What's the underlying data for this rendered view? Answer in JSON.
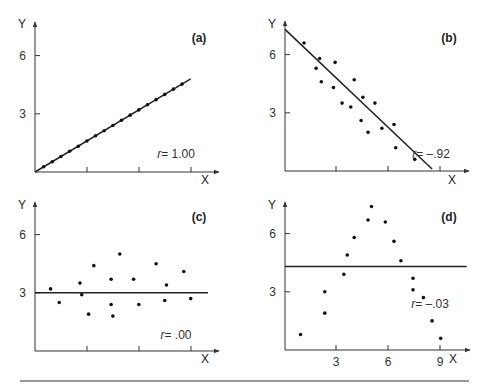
{
  "figure": {
    "bottom_rule": true
  },
  "chart_data": [
    {
      "panel": "(a)",
      "type": "scatter",
      "title": "",
      "xlabel": "X",
      "ylabel": "Y",
      "yticks": [
        "3",
        "6"
      ],
      "xticks": [],
      "ylim": [
        0,
        8
      ],
      "xlim": [
        0,
        10
      ],
      "annotation": "r = 1.00",
      "r": 1.0,
      "fit_line": {
        "x": [
          0,
          9
        ],
        "y": [
          0,
          4.8
        ]
      },
      "points": {
        "x": [
          0.5,
          1.0,
          1.5,
          2.0,
          2.5,
          3.0,
          3.5,
          4.0,
          4.5,
          5.0,
          5.5,
          6.0,
          6.5,
          7.0,
          7.5,
          8.0,
          8.5
        ],
        "y": [
          0.27,
          0.53,
          0.8,
          1.07,
          1.33,
          1.6,
          1.87,
          2.13,
          2.4,
          2.67,
          2.93,
          3.2,
          3.47,
          3.73,
          4.0,
          4.27,
          4.53
        ]
      }
    },
    {
      "panel": "(b)",
      "type": "scatter",
      "title": "",
      "xlabel": "X",
      "ylabel": "Y",
      "yticks": [
        "3",
        "6"
      ],
      "xticks": [],
      "ylim": [
        0,
        8
      ],
      "xlim": [
        0,
        10
      ],
      "annotation": "r = -.92",
      "r": -0.92,
      "fit_line": {
        "x": [
          0,
          8.5
        ],
        "y": [
          7.3,
          0.1
        ]
      },
      "points": {
        "x": [
          1.1,
          2.0,
          1.8,
          2.9,
          2.1,
          2.8,
          3.3,
          4.0,
          3.8,
          4.5,
          4.4,
          5.2,
          4.8,
          5.6,
          6.3,
          6.4,
          7.5
        ],
        "y": [
          6.6,
          5.8,
          5.3,
          5.6,
          4.6,
          4.3,
          3.5,
          4.7,
          3.3,
          3.8,
          2.6,
          3.5,
          2.0,
          2.2,
          2.4,
          1.2,
          0.6
        ]
      }
    },
    {
      "panel": "(c)",
      "type": "scatter",
      "title": "",
      "xlabel": "X",
      "ylabel": "Y",
      "yticks": [
        "3",
        "6"
      ],
      "xticks": [],
      "ylim": [
        0,
        8
      ],
      "xlim": [
        0,
        10
      ],
      "annotation": "r = .00",
      "r": 0.0,
      "fit_line": {
        "x": [
          0,
          10
        ],
        "y": [
          3.0,
          3.0
        ]
      },
      "points": {
        "x": [
          0.9,
          1.4,
          2.6,
          2.7,
          3.1,
          3.4,
          4.4,
          4.4,
          4.5,
          4.9,
          5.7,
          6.0,
          7.0,
          7.5,
          7.6,
          8.6,
          9.0
        ],
        "y": [
          3.2,
          2.5,
          3.5,
          2.9,
          1.9,
          4.4,
          3.7,
          2.4,
          1.8,
          5.0,
          3.7,
          2.4,
          4.5,
          2.6,
          3.4,
          4.1,
          2.7
        ]
      }
    },
    {
      "panel": "(d)",
      "type": "scatter",
      "title": "",
      "xlabel": "X",
      "ylabel": "Y",
      "yticks": [
        "3",
        "6"
      ],
      "xticks": [
        "3",
        "6",
        "9"
      ],
      "ylim": [
        0,
        8
      ],
      "xlim": [
        0,
        10.5
      ],
      "annotation": "r = -.03",
      "r": -0.03,
      "fit_line": {
        "x": [
          0,
          10.5
        ],
        "y": [
          4.3,
          4.3
        ]
      },
      "points": {
        "x": [
          0.9,
          2.3,
          2.3,
          3.4,
          3.6,
          4.0,
          4.8,
          5.0,
          5.8,
          6.3,
          6.7,
          7.4,
          7.4,
          8.0,
          8.5,
          9.0
        ],
        "y": [
          0.8,
          1.9,
          3.0,
          3.9,
          4.9,
          5.8,
          6.7,
          7.4,
          6.6,
          5.6,
          4.6,
          3.7,
          3.1,
          2.7,
          1.5,
          0.6
        ]
      }
    }
  ]
}
